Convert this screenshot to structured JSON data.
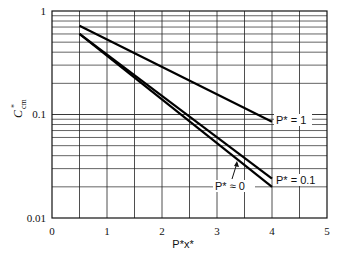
{
  "chart_data": {
    "type": "line",
    "title": "",
    "xlabel": "P*x*",
    "ylabel": "C*cm",
    "yscale": "log",
    "xlim": [
      0,
      5
    ],
    "ylim": [
      0.01,
      1
    ],
    "grid": true,
    "x_ticks": [
      "0",
      "1",
      "2",
      "3",
      "4",
      "5"
    ],
    "y_ticks": [
      "0.01",
      "0.1",
      "1"
    ],
    "series": [
      {
        "name": "P* = 1",
        "x": [
          0.5,
          4.0
        ],
        "y": [
          0.72,
          0.085
        ]
      },
      {
        "name": "P* = 0.1",
        "x": [
          0.5,
          4.0
        ],
        "y": [
          0.6,
          0.024
        ]
      },
      {
        "name": "P* ≈ 0",
        "x": [
          0.5,
          4.0
        ],
        "y": [
          0.6,
          0.02
        ]
      }
    ],
    "annotations": [
      {
        "text": "P* = 1",
        "x": 4.05,
        "y": 0.085
      },
      {
        "text": "P* = 0.1",
        "x": 4.05,
        "y": 0.022
      },
      {
        "text": "P* ≈ 0",
        "x": 3.1,
        "y": 0.018,
        "arrow_to": [
          3.35,
          0.032
        ]
      }
    ]
  },
  "labels": {
    "y_axis": "C",
    "y_axis_sup": "*",
    "y_axis_sub": "cm",
    "x_axis": "P*x*",
    "y_tick_1": "1",
    "y_tick_01": "0.1",
    "y_tick_001": "0.01",
    "x_ticks": [
      "0",
      "1",
      "2",
      "3",
      "4",
      "5"
    ],
    "series_p1": "P* = 1",
    "series_p01": "P* = 0.1",
    "series_p0": "P* ≈ 0"
  }
}
